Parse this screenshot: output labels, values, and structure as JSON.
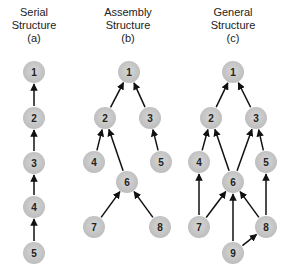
{
  "panels": [
    {
      "id": "a",
      "title_line1": "Serial",
      "title_line2": "Structure",
      "title_line3": "(a)",
      "title_x": 34
    },
    {
      "id": "b",
      "title_line1": "Assembly",
      "title_line2": "Structure",
      "title_line3": "(b)",
      "title_x": 128
    },
    {
      "id": "c",
      "title_line1": "General",
      "title_line2": "Structure",
      "title_line3": "(c)",
      "title_x": 233
    }
  ],
  "graphs": {
    "a": {
      "nodes": [
        {
          "id": "1",
          "x": 34,
          "y": 72
        },
        {
          "id": "2",
          "x": 34,
          "y": 118
        },
        {
          "id": "3",
          "x": 34,
          "y": 163
        },
        {
          "id": "4",
          "x": 34,
          "y": 207
        },
        {
          "id": "5",
          "x": 34,
          "y": 253
        }
      ],
      "edges": [
        [
          "2",
          "1"
        ],
        [
          "3",
          "2"
        ],
        [
          "4",
          "3"
        ],
        [
          "5",
          "4"
        ]
      ]
    },
    "b": {
      "nodes": [
        {
          "id": "1",
          "x": 129,
          "y": 72
        },
        {
          "id": "2",
          "x": 105,
          "y": 118
        },
        {
          "id": "3",
          "x": 150,
          "y": 118
        },
        {
          "id": "4",
          "x": 94,
          "y": 162
        },
        {
          "id": "5",
          "x": 161,
          "y": 162
        },
        {
          "id": "6",
          "x": 127,
          "y": 182
        },
        {
          "id": "7",
          "x": 94,
          "y": 227
        },
        {
          "id": "8",
          "x": 160,
          "y": 227
        }
      ],
      "edges": [
        [
          "2",
          "1"
        ],
        [
          "3",
          "1"
        ],
        [
          "4",
          "2"
        ],
        [
          "6",
          "2"
        ],
        [
          "5",
          "3"
        ],
        [
          "7",
          "6"
        ],
        [
          "8",
          "6"
        ]
      ]
    },
    "c": {
      "nodes": [
        {
          "id": "1",
          "x": 233,
          "y": 72
        },
        {
          "id": "2",
          "x": 211,
          "y": 118
        },
        {
          "id": "3",
          "x": 256,
          "y": 118
        },
        {
          "id": "4",
          "x": 199,
          "y": 162
        },
        {
          "id": "5",
          "x": 266,
          "y": 162
        },
        {
          "id": "6",
          "x": 233,
          "y": 182
        },
        {
          "id": "7",
          "x": 199,
          "y": 227
        },
        {
          "id": "8",
          "x": 266,
          "y": 227
        },
        {
          "id": "9",
          "x": 233,
          "y": 253
        }
      ],
      "edges": [
        [
          "2",
          "1"
        ],
        [
          "3",
          "1"
        ],
        [
          "4",
          "2"
        ],
        [
          "6",
          "2"
        ],
        [
          "6",
          "3"
        ],
        [
          "5",
          "3"
        ],
        [
          "7",
          "4"
        ],
        [
          "7",
          "6"
        ],
        [
          "9",
          "6"
        ],
        [
          "8",
          "6"
        ],
        [
          "8",
          "5"
        ],
        [
          "9",
          "8"
        ]
      ]
    }
  },
  "style": {
    "node_fill": "#c9c9c9",
    "node_radius": 11,
    "edge_color": "#111111"
  }
}
